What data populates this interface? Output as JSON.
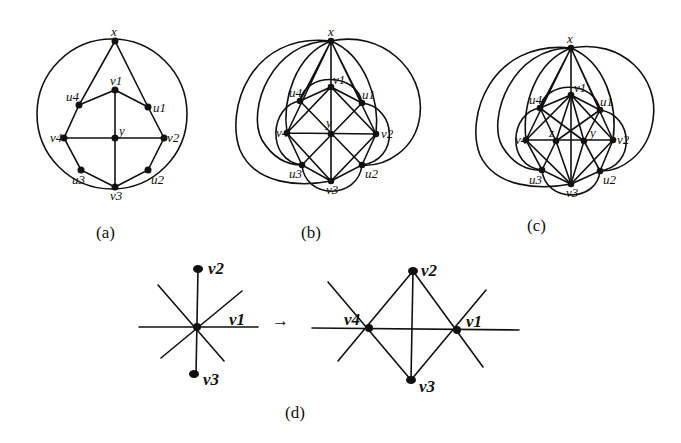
{
  "figure": {
    "captions": {
      "a": "(a)",
      "b": "(b)",
      "c": "(c)",
      "d": "(d)"
    },
    "arrow": "→",
    "panel_a": {
      "labels": {
        "x": "x",
        "v1": "v1",
        "v2": "v2",
        "v3": "v3",
        "v4": "v4",
        "u1": "u1",
        "u2": "u2",
        "u3": "u3",
        "u4": "u4",
        "y": "y"
      }
    },
    "panel_b": {
      "labels": {
        "x": "x",
        "v1": "v1",
        "v2": "v2",
        "v3": "v3",
        "v4": "v4",
        "u1": "u1",
        "u2": "u2",
        "u3": "u3",
        "u4": "u4",
        "y": "y"
      }
    },
    "panel_c": {
      "labels": {
        "x": "x",
        "v1": "v1",
        "v2": "v2",
        "v3": "v3",
        "v4": "v4",
        "u1": "u1",
        "u2": "u2",
        "u3": "u3",
        "u4": "u4",
        "y": "y",
        "z": "z"
      }
    },
    "panel_d": {
      "left": {
        "v1": "v1",
        "v2": "v2",
        "v3": "v3"
      },
      "right": {
        "v1": "v1",
        "v2": "v2",
        "v3": "v3",
        "v4": "v4"
      }
    }
  }
}
